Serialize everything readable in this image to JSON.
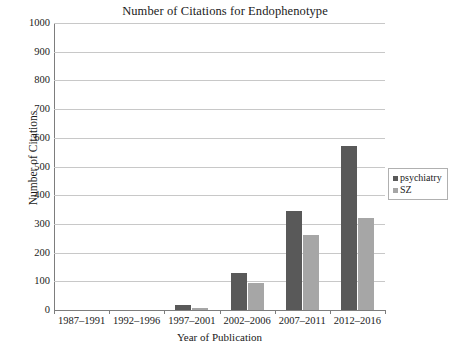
{
  "chart_data": {
    "type": "bar",
    "title": "Number of Citations for Endophenotype",
    "xlabel": "Year of Publication",
    "ylabel": "Number of Citations",
    "categories": [
      "1987–1991",
      "1992–1996",
      "1997–2001",
      "2002–2006",
      "2007–2011",
      "2012–2016"
    ],
    "series": [
      {
        "name": "psychiatry",
        "color": "#595959",
        "values": [
          0,
          0,
          18,
          130,
          345,
          570
        ]
      },
      {
        "name": "SZ",
        "color": "#a6a6a6",
        "values": [
          0,
          0,
          8,
          95,
          262,
          320
        ]
      }
    ],
    "ylim": [
      0,
      1000
    ],
    "ytick_labels": [
      "1000",
      "900",
      "800",
      "700",
      "600",
      "500",
      "400",
      "300",
      "200",
      "100",
      "0"
    ],
    "ytick_values": [
      1000,
      900,
      800,
      700,
      600,
      500,
      400,
      300,
      200,
      100,
      0
    ],
    "grid": true,
    "legend_position": "right"
  }
}
